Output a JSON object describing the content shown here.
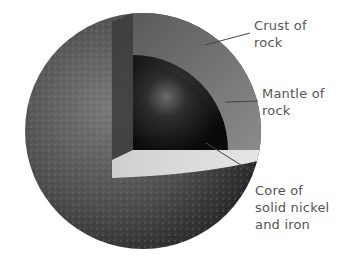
{
  "diagram": {
    "colors": {
      "background": "#ffffff",
      "surface": "#5a5a5a",
      "crust_band": "#8a8a8a",
      "mantle": "#6e6e6e",
      "core": "#1a1a1a",
      "leader_line": "#444444",
      "label_text": "#555555"
    },
    "labels": [
      {
        "id": "crust",
        "lines": [
          "Crust of",
          "rock"
        ]
      },
      {
        "id": "mantle",
        "lines": [
          "Mantle of",
          "rock"
        ]
      },
      {
        "id": "core",
        "lines": [
          "Core of",
          "solid nickel",
          "and iron"
        ]
      }
    ]
  }
}
